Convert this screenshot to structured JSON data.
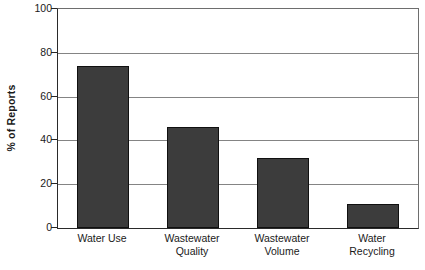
{
  "chart_data": {
    "type": "bar",
    "title": "",
    "subtitle": "",
    "xlabel": "",
    "ylabel": "% of Reports",
    "ylim": [
      0,
      100
    ],
    "yticks": [
      0,
      20,
      40,
      60,
      80,
      100
    ],
    "ytick_labels": [
      "0",
      "20",
      "40",
      "60",
      "80",
      "100"
    ],
    "grid": true,
    "legend": false,
    "legend_position": "none",
    "bar_color": "#3c3c3c",
    "bar_edge_color": "#101010",
    "axis_color": "#2a2a2a",
    "gridline_color": "#848484",
    "categories": [
      "Water Use",
      "Wastewater Quality",
      "Wastewater Volume",
      "Water Recycling"
    ],
    "category_label_lines": [
      [
        "Water Use",
        ""
      ],
      [
        "Wastewater",
        "Quality"
      ],
      [
        "Wastewater",
        "Volume"
      ],
      [
        "Water",
        "Recycling"
      ]
    ],
    "values": [
      74,
      46,
      32,
      11
    ],
    "series": [
      {
        "name": "% of Reports",
        "values": [
          74,
          46,
          32,
          11
        ]
      }
    ]
  }
}
